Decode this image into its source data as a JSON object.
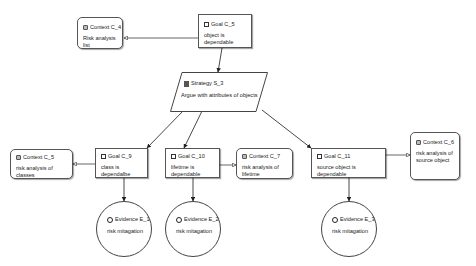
{
  "diagram": {
    "type": "GSN goal structure",
    "nodes": {
      "context_c4": {
        "kind": "Context",
        "id": "Context C_4",
        "text": "Risk analysis list"
      },
      "goal_c5": {
        "kind": "Goal",
        "id": "Goal C_5",
        "text": "object is dependable"
      },
      "strategy_s3": {
        "kind": "Strategy",
        "id": "Strategy S_3",
        "text": "Argue with attributes of objects"
      },
      "context_c5": {
        "kind": "Context",
        "id": "Context C_5",
        "text": "risk analysis of classes"
      },
      "goal_c9": {
        "kind": "Goal",
        "id": "Goal C_9",
        "text": "class is dependalbe"
      },
      "goal_c10": {
        "kind": "Goal",
        "id": "Goal C_10",
        "text": "lifetime is dependable"
      },
      "context_c7": {
        "kind": "Context",
        "id": "Context C_7",
        "text": "risk analysis of lifetime"
      },
      "goal_c11": {
        "kind": "Goal",
        "id": "Goal C_11",
        "text": "source object is dependable"
      },
      "context_c6": {
        "kind": "Context",
        "id": "Context C_6",
        "text": "risk analysis of source object"
      },
      "evidence_e1": {
        "kind": "Evidence",
        "id": "Evidence E_1",
        "text": "risk mitagation"
      },
      "evidence_e2": {
        "kind": "Evidence",
        "id": "Evidence E_2",
        "text": "risk mitagation"
      },
      "evidence_e3": {
        "kind": "Evidence",
        "id": "Evidence E_3",
        "text": "risk mitagation"
      }
    },
    "edges": [
      {
        "from": "Goal C_5",
        "to": "Context C_4",
        "type": "in-context-of"
      },
      {
        "from": "Goal C_5",
        "to": "Strategy S_3",
        "type": "supported-by"
      },
      {
        "from": "Strategy S_3",
        "to": "Goal C_9",
        "type": "supported-by"
      },
      {
        "from": "Strategy S_3",
        "to": "Goal C_10",
        "type": "supported-by"
      },
      {
        "from": "Strategy S_3",
        "to": "Goal C_11",
        "type": "supported-by"
      },
      {
        "from": "Goal C_9",
        "to": "Context C_5",
        "type": "in-context-of"
      },
      {
        "from": "Goal C_10",
        "to": "Context C_7",
        "type": "in-context-of"
      },
      {
        "from": "Goal C_11",
        "to": "Context C_6",
        "type": "in-context-of"
      },
      {
        "from": "Goal C_9",
        "to": "Evidence E_1",
        "type": "supported-by"
      },
      {
        "from": "Goal C_10",
        "to": "Evidence E_2",
        "type": "supported-by"
      },
      {
        "from": "Goal C_11",
        "to": "Evidence E_3",
        "type": "supported-by"
      }
    ],
    "colors": {
      "stroke": "#444444",
      "arrow": "#222222",
      "background": "#ffffff"
    }
  }
}
